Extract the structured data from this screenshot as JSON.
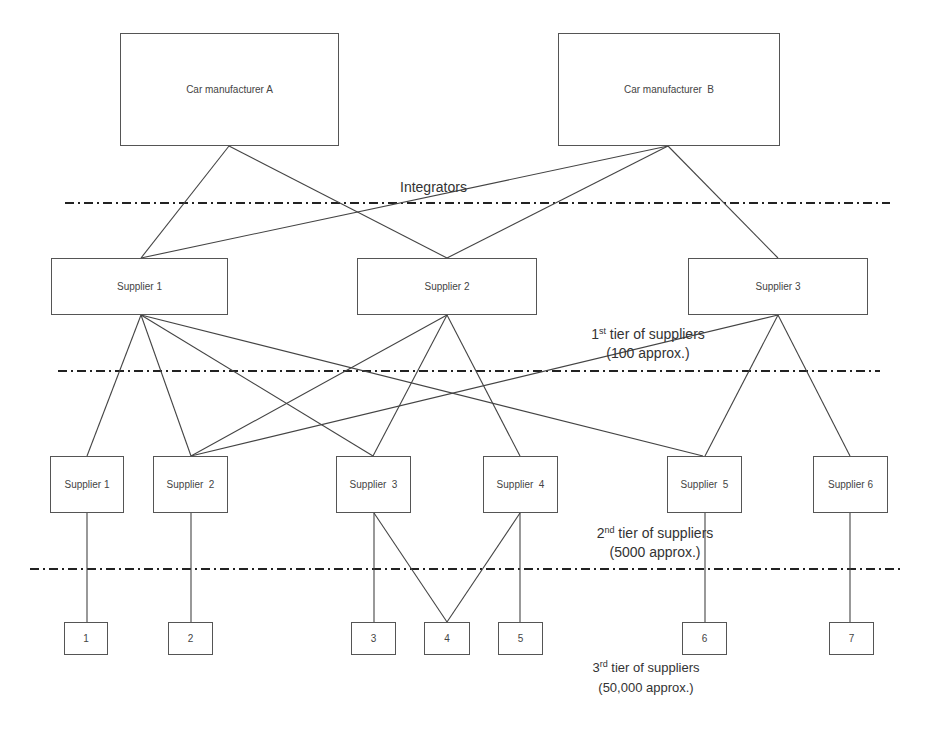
{
  "diagram": {
    "manufacturers": [
      {
        "id": "A",
        "label": "Car manufacturer A",
        "x": 120,
        "y": 33,
        "w": 219,
        "h": 113
      },
      {
        "id": "B",
        "label": "Car manufacturer  B",
        "x": 558,
        "y": 33,
        "w": 222,
        "h": 113
      }
    ],
    "tier1": [
      {
        "id": "t1s1",
        "label": "Supplier 1",
        "x": 51,
        "y": 258,
        "w": 177,
        "h": 57
      },
      {
        "id": "t1s2",
        "label": "Supplier 2",
        "x": 357,
        "y": 258,
        "w": 180,
        "h": 57
      },
      {
        "id": "t1s3",
        "label": "Supplier 3",
        "x": 688,
        "y": 258,
        "w": 180,
        "h": 57
      }
    ],
    "tier2": [
      {
        "id": "t2s1",
        "label": "Supplier 1",
        "x": 50,
        "y": 456,
        "w": 74,
        "h": 57
      },
      {
        "id": "t2s2",
        "label": "Supplier  2",
        "x": 153,
        "y": 456,
        "w": 75,
        "h": 57
      },
      {
        "id": "t2s3",
        "label": "Supplier  3",
        "x": 336,
        "y": 456,
        "w": 75,
        "h": 57
      },
      {
        "id": "t2s4",
        "label": "Supplier  4",
        "x": 483,
        "y": 456,
        "w": 75,
        "h": 57
      },
      {
        "id": "t2s5",
        "label": "Supplier  5",
        "x": 667,
        "y": 456,
        "w": 75,
        "h": 57
      },
      {
        "id": "t2s6",
        "label": "Supplier 6",
        "x": 813,
        "y": 456,
        "w": 75,
        "h": 57
      }
    ],
    "tier3": [
      {
        "id": "t3n1",
        "label": "1",
        "x": 64,
        "y": 622,
        "w": 44,
        "h": 33
      },
      {
        "id": "t3n2",
        "label": "2",
        "x": 168,
        "y": 622,
        "w": 45,
        "h": 33
      },
      {
        "id": "t3n3",
        "label": "3",
        "x": 351,
        "y": 622,
        "w": 45,
        "h": 33
      },
      {
        "id": "t3n4",
        "label": "4",
        "x": 424,
        "y": 622,
        "w": 46,
        "h": 33
      },
      {
        "id": "t3n5",
        "label": "5",
        "x": 498,
        "y": 622,
        "w": 45,
        "h": 33
      },
      {
        "id": "t3n6",
        "label": "6",
        "x": 682,
        "y": 622,
        "w": 45,
        "h": 33
      },
      {
        "id": "t3n7",
        "label": "7",
        "x": 829,
        "y": 622,
        "w": 45,
        "h": 33
      }
    ],
    "tier_labels": {
      "integrators": {
        "text": "Integrators"
      },
      "tier1": {
        "ordinal": "1",
        "suffix": "st",
        "line1_rest": " tier of suppliers",
        "line2": "(100 approx.)"
      },
      "tier2": {
        "ordinal": "2",
        "suffix": "nd",
        "line1_rest": " tier of suppliers",
        "line2": "(5000 approx.)"
      },
      "tier3": {
        "ordinal": "3",
        "suffix": "rd",
        "line1_rest": " tier of suppliers",
        "line2": "(50,000 approx.)"
      }
    },
    "dividers": [
      {
        "name": "integrators-divider",
        "x1": 65,
        "x2": 890,
        "y": 203
      },
      {
        "name": "tier1-divider",
        "x1": 58,
        "x2": 880,
        "y": 371
      },
      {
        "name": "tier2-divider",
        "x1": 30,
        "x2": 900,
        "y": 569
      }
    ],
    "connections": [
      {
        "from": "A",
        "to": "t1s1",
        "x1": 229,
        "y1": 146,
        "x2": 141,
        "y2": 258
      },
      {
        "from": "A",
        "to": "t1s2",
        "x1": 229,
        "y1": 146,
        "x2": 447,
        "y2": 258
      },
      {
        "from": "B",
        "to": "t1s1",
        "x1": 668,
        "y1": 146,
        "x2": 141,
        "y2": 258
      },
      {
        "from": "B",
        "to": "t1s2",
        "x1": 668,
        "y1": 146,
        "x2": 447,
        "y2": 258
      },
      {
        "from": "B",
        "to": "t1s3",
        "x1": 668,
        "y1": 146,
        "x2": 778,
        "y2": 258
      },
      {
        "from": "t1s1",
        "to": "t2s1",
        "x1": 141,
        "y1": 315,
        "x2": 87,
        "y2": 456
      },
      {
        "from": "t1s1",
        "to": "t2s2",
        "x1": 141,
        "y1": 315,
        "x2": 191,
        "y2": 456
      },
      {
        "from": "t1s1",
        "to": "t2s3",
        "x1": 141,
        "y1": 315,
        "x2": 373,
        "y2": 456
      },
      {
        "from": "t1s1",
        "to": "t2s5",
        "x1": 141,
        "y1": 315,
        "x2": 703,
        "y2": 456
      },
      {
        "from": "t1s2",
        "to": "t2s2",
        "x1": 447,
        "y1": 315,
        "x2": 191,
        "y2": 456
      },
      {
        "from": "t1s2",
        "to": "t2s3",
        "x1": 447,
        "y1": 315,
        "x2": 373,
        "y2": 456
      },
      {
        "from": "t1s2",
        "to": "t2s4",
        "x1": 447,
        "y1": 315,
        "x2": 520,
        "y2": 456
      },
      {
        "from": "t1s3",
        "to": "t2s2",
        "x1": 778,
        "y1": 315,
        "x2": 191,
        "y2": 456
      },
      {
        "from": "t1s3",
        "to": "t2s5",
        "x1": 778,
        "y1": 315,
        "x2": 705,
        "y2": 456
      },
      {
        "from": "t1s3",
        "to": "t2s6",
        "x1": 778,
        "y1": 315,
        "x2": 850,
        "y2": 456
      },
      {
        "from": "t2s1",
        "to": "t3n1",
        "x1": 87,
        "y1": 513,
        "x2": 87,
        "y2": 622
      },
      {
        "from": "t2s2",
        "to": "t3n2",
        "x1": 191,
        "y1": 513,
        "x2": 191,
        "y2": 622
      },
      {
        "from": "t2s3",
        "to": "t3n3",
        "x1": 374,
        "y1": 513,
        "x2": 374,
        "y2": 622
      },
      {
        "from": "t2s3",
        "to": "t3n4",
        "x1": 374,
        "y1": 513,
        "x2": 447,
        "y2": 622
      },
      {
        "from": "t2s4",
        "to": "t3n4",
        "x1": 520,
        "y1": 513,
        "x2": 447,
        "y2": 622
      },
      {
        "from": "t2s4",
        "to": "t3n5",
        "x1": 520,
        "y1": 513,
        "x2": 520,
        "y2": 622
      },
      {
        "from": "t2s5",
        "to": "t3n6",
        "x1": 705,
        "y1": 513,
        "x2": 705,
        "y2": 622
      },
      {
        "from": "t2s6",
        "to": "t3n7",
        "x1": 850,
        "y1": 513,
        "x2": 850,
        "y2": 622
      }
    ],
    "colors": {
      "line": "#444444",
      "divider": "#222222",
      "box_border": "#555555",
      "text": "#333333"
    }
  }
}
